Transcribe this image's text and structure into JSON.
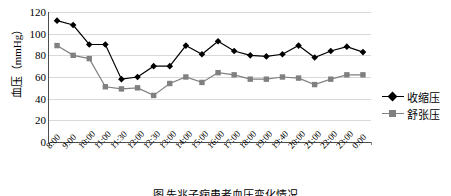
{
  "chart_data": {
    "type": "line",
    "title": "",
    "xlabel": "",
    "ylabel": "血压（mmHg）",
    "ylim": [
      0,
      120
    ],
    "yticks": [
      120,
      100,
      80,
      60,
      40,
      20,
      0
    ],
    "grid": true,
    "legend_position": "right",
    "categories": [
      "8:00",
      "9:00",
      "10:00",
      "11:00",
      "11:30",
      "12:00",
      "12:30",
      "13:00",
      "14:00",
      "15:00",
      "16:00",
      "17:00",
      "18:00",
      "19:00",
      "19:40",
      "20:00",
      "21:00",
      "22:00",
      "23:00",
      "0:00"
    ],
    "series": [
      {
        "name": "收缩压",
        "color": "#000000",
        "marker": "diamond",
        "values": [
          112,
          108,
          90,
          90,
          58,
          60,
          70,
          70,
          89,
          81,
          93,
          84,
          80,
          79,
          81,
          89,
          78,
          84,
          88,
          83
        ]
      },
      {
        "name": "舒张压",
        "color": "#808080",
        "marker": "square",
        "values": [
          89,
          80,
          77,
          51,
          49,
          50,
          43,
          54,
          60,
          55,
          64,
          62,
          58,
          58,
          60,
          59,
          53,
          58,
          62,
          62
        ]
      }
    ]
  },
  "caption": "图    先兆子痫患者血压变化情况"
}
